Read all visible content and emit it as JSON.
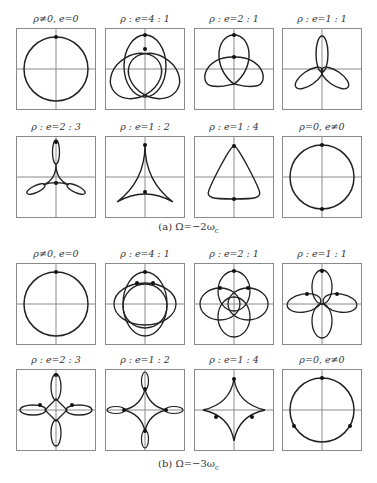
{
  "figure": {
    "section_a": {
      "caption": "(a) Ω=−2ω",
      "caption_sub": "c",
      "panels": [
        {
          "title": "ρ≠0,  e=0",
          "curve": "circle"
        },
        {
          "title": "ρ : e=4 : 1",
          "curve": "trefoil-loops"
        },
        {
          "title": "ρ : e=2 : 1",
          "curve": "trefoil-knot"
        },
        {
          "title": "ρ : e=1 : 1",
          "curve": "three-petal"
        },
        {
          "title": "ρ : e=2 : 3",
          "curve": "three-loops-cusped"
        },
        {
          "title": "ρ : e=1 : 2",
          "curve": "deltoid"
        },
        {
          "title": "ρ : e=1 : 4",
          "curve": "rounded-triangle"
        },
        {
          "title": "ρ=0,  e≠0",
          "curve": "circle"
        }
      ]
    },
    "section_b": {
      "caption": "(b) Ω=−3ω",
      "caption_sub": "c",
      "panels": [
        {
          "title": "ρ≠0,  e=0",
          "curve": "circle"
        },
        {
          "title": "ρ : e=4 : 1",
          "curve": "four-loop-overlap"
        },
        {
          "title": "ρ : e=2 : 1",
          "curve": "four-lobe-knot"
        },
        {
          "title": "ρ : e=1 : 1",
          "curve": "four-petal"
        },
        {
          "title": "ρ : e=2 : 3",
          "curve": "four-loops-cusped"
        },
        {
          "title": "ρ : e=1 : 2",
          "curve": "astroid-with-loops"
        },
        {
          "title": "ρ : e=1 : 4",
          "curve": "astroid-rounded"
        },
        {
          "title": "ρ=0,  e≠0",
          "curve": "circle"
        }
      ]
    }
  },
  "colors": {
    "curve": "#222222",
    "axes": "#8a8a8a",
    "frame": "#8a8a8a",
    "dot": "#111111"
  }
}
